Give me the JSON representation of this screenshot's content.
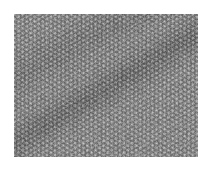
{
  "image": {
    "kind": "grayscale lattice micrograph",
    "description": "Hexagonal atomic-lattice texture with a darker diagonal band from lower-left to upper-right",
    "region": {
      "x": 14,
      "y": 14,
      "width": 184,
      "height": 143
    },
    "colors": {
      "background": "#ffffff",
      "mid_gray": "#8a8a8a",
      "dark_band": "#6e6e6e",
      "light_dot": "#c8c8c8"
    }
  }
}
